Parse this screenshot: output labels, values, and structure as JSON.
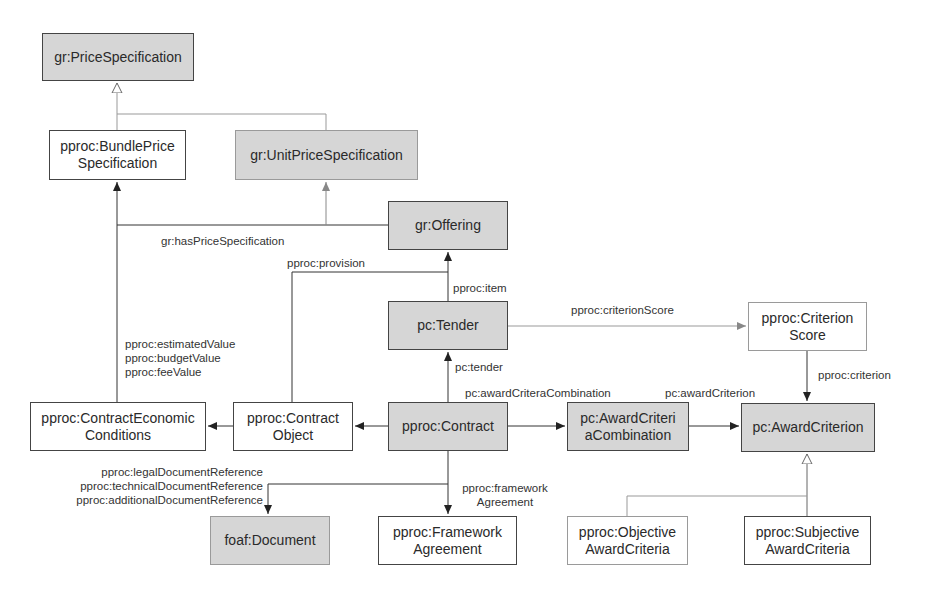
{
  "diagram": {
    "colors": {
      "external_class_fill": "#d6d6d6",
      "internal_class_fill": "#ffffff",
      "line": "#333333",
      "light_line": "#9a9a9a"
    },
    "nodes": {
      "price_specification": "gr:PriceSpecification",
      "bundle_price_specification": "pproc:BundlePrice\nSpecification",
      "unit_price_specification": "gr:UnitPriceSpecification",
      "offering": "gr:Offering",
      "tender": "pc:Tender",
      "criterion_score": "pproc:Criterion\nScore",
      "contract_economic_conditions": "pproc:ContractEconomic\nConditions",
      "contract_object": "pproc:Contract\nObject",
      "contract": "pproc:Contract",
      "award_criteria_combination": "pc:AwardCriteri\naCombination",
      "award_criterion": "pc:AwardCriterion",
      "document": "foaf:Document",
      "framework_agreement": "pproc:Framework\nAgreement",
      "objective_award_criteria": "pproc:Objective\nAwardCriteria",
      "subjective_award_criteria": "pproc:Subjective\nAwardCriteria"
    },
    "edges": {
      "has_price_specification": "gr:hasPriceSpecification",
      "provision": "pproc:provision",
      "item": "pproc:item",
      "criterion_score": "pproc:criterionScore",
      "value_props": "pproc:estimatedValue\npproc:budgetValue\npproc:feeValue",
      "tender": "pc:tender",
      "award_criteria_combination": "pc:awardCriteraCombination",
      "award_criterion": "pc:awardCriterion",
      "criterion": "pproc:criterion",
      "document_refs": "pproc:legalDocumentReference\npproc:technicalDocumentReference\npproc:additionalDocumentReference",
      "framework_agreement": "pproc:framework\nAgreement"
    }
  }
}
